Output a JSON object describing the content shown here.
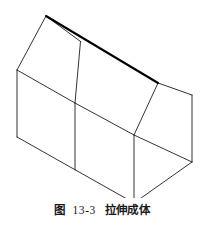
{
  "figure": {
    "caption_label": "图",
    "caption_number": "13-3",
    "caption_title": "拉伸成体",
    "caption_full": "图 13-3 拉伸成体"
  },
  "drawing": {
    "type": "isometric-line-drawing",
    "subject": "extruded-pentagonal-prism-house-shape",
    "stroke_color": "#1c1c1c",
    "bold_stroke_color": "#000000",
    "background_color": "#ffffff",
    "thin_stroke_width": 0.9,
    "bold_stroke_width": 2.1,
    "viewbox": "0 0 204 198",
    "vertices": {
      "apex_back": [
        46,
        16
      ],
      "apex_front": [
        158,
        83
      ],
      "eave_left_back": [
        17,
        70
      ],
      "eave_left_front": [
        75,
        103
      ],
      "eave_right_back": [
        80.5,
        41.5
      ],
      "eave_right_front": [
        134,
        135
      ],
      "ridge_right_top": [
        192,
        95
      ],
      "base_left_back": [
        17,
        137
      ],
      "base_left_front": [
        75,
        170
      ],
      "base_front": [
        134,
        203
      ],
      "base_right": [
        192,
        162
      ]
    },
    "edges": [
      {
        "name": "ridge-line",
        "from": "apex_back",
        "to": "apex_front",
        "weight": "bold"
      },
      {
        "name": "roof-left-slope-back",
        "from": "apex_back",
        "to": "eave_left_back",
        "weight": "thin"
      },
      {
        "name": "roof-right-slope-back",
        "from": "apex_back",
        "to": "eave_right_back",
        "weight": "thin"
      },
      {
        "name": "gable-ridge-to-right-corner",
        "from": "apex_front",
        "to": "ridge_right_top",
        "weight": "thin"
      },
      {
        "name": "gable-ridge-to-front-eave",
        "from": "apex_front",
        "to": "eave_right_front",
        "weight": "thin"
      },
      {
        "name": "eave-left-edge",
        "from": "eave_left_back",
        "to": "eave_left_front",
        "weight": "thin"
      },
      {
        "name": "eave-right-edge",
        "from": "eave_left_front",
        "to": "eave_right_front",
        "weight": "thin"
      },
      {
        "name": "center-vertical-roof",
        "from": "eave_right_back",
        "to": "eave_left_front",
        "weight": "thin"
      },
      {
        "name": "left-wall-vertical-back",
        "from": "eave_left_back",
        "to": "base_left_back",
        "weight": "thin"
      },
      {
        "name": "left-wall-vertical-front",
        "from": "eave_left_front",
        "to": "base_left_front",
        "weight": "thin"
      },
      {
        "name": "front-vertical",
        "from": "eave_right_front",
        "to": "base_front",
        "weight": "thin"
      },
      {
        "name": "right-vertical",
        "from": "ridge_right_top",
        "to": "base_right",
        "weight": "thin"
      },
      {
        "name": "base-left-edge",
        "from": "base_left_back",
        "to": "base_front",
        "weight": "thin"
      },
      {
        "name": "base-front-right-edge",
        "from": "base_front",
        "to": "base_right",
        "weight": "thin"
      },
      {
        "name": "base-right-back-edge",
        "from": "base_right",
        "to": "eave_right_front",
        "weight": "thin"
      }
    ]
  }
}
